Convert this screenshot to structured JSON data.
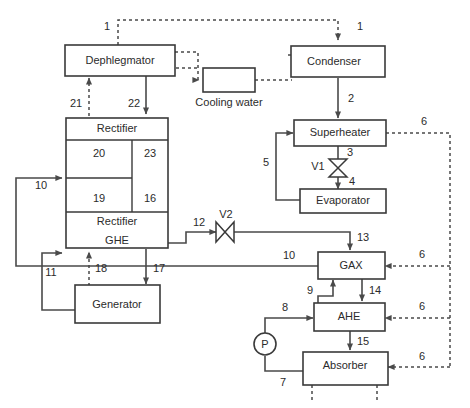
{
  "diagram": {
    "colors": {
      "line": "#4a4a4a",
      "box_stroke": "#3a3a3a",
      "text": "#2b2b2b",
      "background": "#ffffff"
    }
  },
  "units": {
    "dephlegmator": "Dephlegmator",
    "condenser": "Condenser",
    "cooling_water": "Cooling water",
    "rectifier_top": "Rectifier",
    "rectifier_bottom": "Rectifier",
    "ghe": "GHE",
    "generator": "Generator",
    "superheater": "Superheater",
    "evaporator": "Evaporator",
    "gax": "GAX",
    "ahe": "AHE",
    "absorber": "Absorber"
  },
  "trays": {
    "upper_left": "20",
    "upper_right": "23",
    "lower_left": "19",
    "lower_right": "16"
  },
  "valves": {
    "v1": "V1",
    "v2": "V2"
  },
  "pump": {
    "label": "P"
  },
  "streams": {
    "s1_left": "1",
    "s1_right": "1",
    "s2": "2",
    "s3": "3",
    "s4": "4",
    "s5": "5",
    "s6_superheater": "6",
    "s6_gax": "6",
    "s6_ahe": "6",
    "s6_absorber": "6",
    "s7": "7",
    "s8": "8",
    "s9": "9",
    "s10_left": "10",
    "s10_gax": "10",
    "s11": "11",
    "s12": "12",
    "s13": "13",
    "s14": "14",
    "s15": "15",
    "s16": "16",
    "s17": "17",
    "s18": "18",
    "s19": "19",
    "s20": "20",
    "s21": "21",
    "s22": "22",
    "s23": "23"
  }
}
